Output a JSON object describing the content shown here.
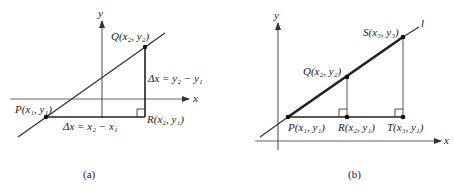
{
  "panels": [
    {
      "id": "a",
      "caption": "(a)",
      "axes": {
        "x_label": "x",
        "y_label": "y"
      },
      "points": {
        "P": "P(x₁, y₁)",
        "Q": "Q(x₂, y₂)",
        "R": "R(x₂, y₁)"
      },
      "annotations": {
        "horizontal": "Δx = x₂ − x₁",
        "vertical": "Δx = y₂ − y₁"
      }
    },
    {
      "id": "b",
      "caption": "(b)",
      "axes": {
        "x_label": "x",
        "y_label": "y"
      },
      "line_label": "l",
      "points": {
        "P": "P(x₁, y₁)",
        "Q": "Q(x₂, y₂)",
        "R": "R(x₂, y₁)",
        "S": "S(x₃, y₃)",
        "T": "T(x₃, y₁)"
      }
    }
  ],
  "colors": {
    "stroke": "#333333",
    "text": "#222222",
    "background": "#ffffff"
  }
}
